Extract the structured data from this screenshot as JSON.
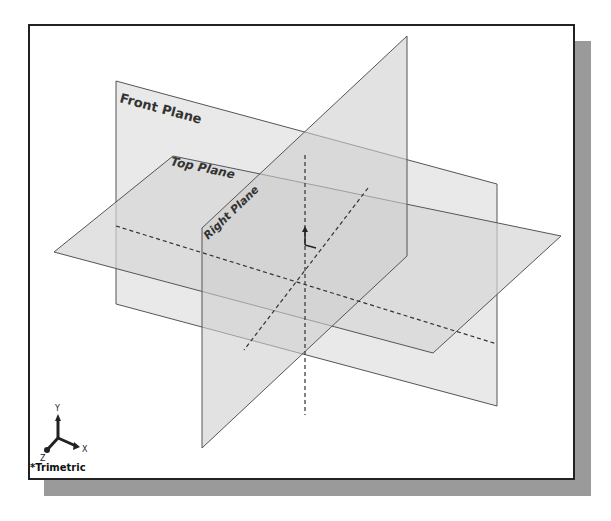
{
  "viewport": {
    "view_orientation": "*Trimetric",
    "frame_color": "#222222",
    "shadow_color": "#9a9a9a",
    "plane_fill": "#d9d9d9",
    "plane_edge": "#555555"
  },
  "planes": [
    {
      "name": "Front Plane",
      "label": "Front Plane"
    },
    {
      "name": "Top Plane",
      "label": "Top Plane"
    },
    {
      "name": "Right Plane",
      "label": "Right Plane"
    }
  ],
  "triad": {
    "x_label": "X",
    "y_label": "Y",
    "z_label": "Z"
  }
}
